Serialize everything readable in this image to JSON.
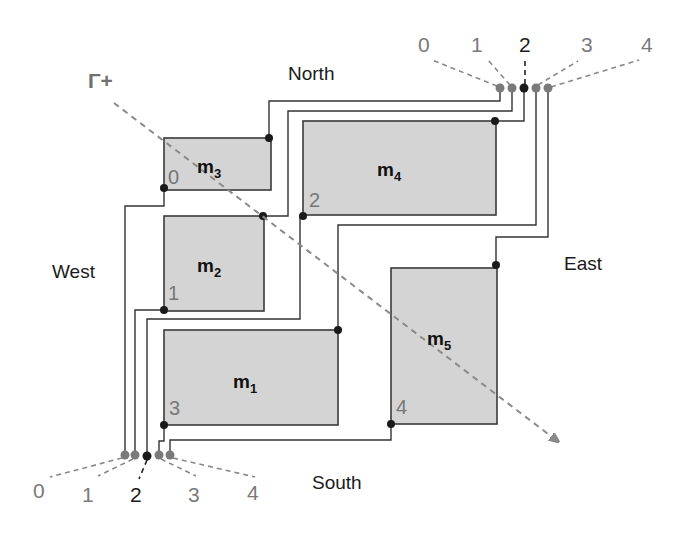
{
  "diagram": {
    "sides": {
      "north": "North",
      "south": "South",
      "east": "East",
      "west": "West"
    },
    "gamma": {
      "label": "Γ+",
      "color": "#8a8a8a"
    },
    "modules": [
      {
        "id": "m1",
        "base": "m",
        "sub": "1"
      },
      {
        "id": "m2",
        "base": "m",
        "sub": "2"
      },
      {
        "id": "m3",
        "base": "m",
        "sub": "3"
      },
      {
        "id": "m4",
        "base": "m",
        "sub": "4"
      },
      {
        "id": "m5",
        "base": "m",
        "sub": "5"
      }
    ],
    "pin_labels": {
      "m3": "0",
      "m2": "1",
      "m4": "2",
      "m1": "3",
      "m5": "4"
    },
    "north_terminals": [
      "0",
      "1",
      "2",
      "3",
      "4"
    ],
    "south_terminals": [
      "0",
      "1",
      "2",
      "3",
      "4"
    ],
    "highlighted_terminal": "2",
    "colors": {
      "module_fill": "#d4d4d4",
      "wire": "#333333",
      "terminal_inactive": "#7a7a7a",
      "terminal_active": "#1a1a1a"
    }
  }
}
